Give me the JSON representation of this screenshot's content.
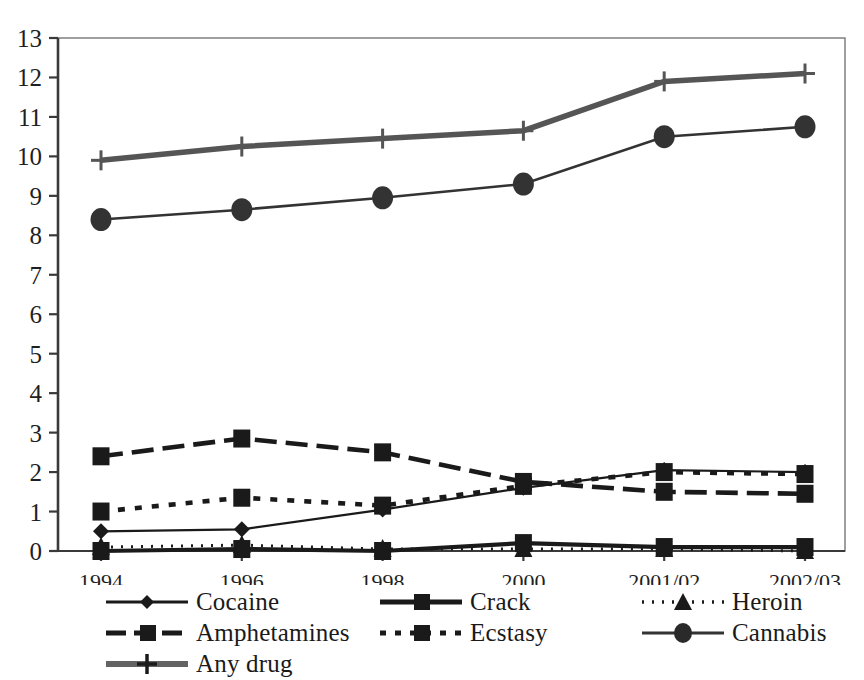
{
  "chart_data": {
    "type": "line",
    "title": "",
    "subtitle": "",
    "xlabel": "",
    "ylabel": "",
    "categories": [
      "1994",
      "1996",
      "1998",
      "2000",
      "2001/02",
      "2002/03"
    ],
    "x": [
      0,
      1,
      2,
      3,
      4,
      5
    ],
    "ylim": [
      0,
      13
    ],
    "yticks": [
      0,
      1,
      2,
      3,
      4,
      5,
      6,
      7,
      8,
      9,
      10,
      11,
      12,
      13
    ],
    "ytick_labels": [
      "0",
      "1",
      "2",
      "3",
      "4",
      "5",
      "6",
      "7",
      "8",
      "9",
      "10",
      "11",
      "12",
      "13"
    ],
    "grid": false,
    "legend_position": "below-plot",
    "series": [
      {
        "name": "Cocaine",
        "marker": "diamond",
        "dash": "solid",
        "color": "#1a1a1a",
        "values": [
          0.5,
          0.55,
          1.05,
          1.6,
          2.05,
          2.0
        ]
      },
      {
        "name": "Crack",
        "marker": "square",
        "dash": "solid",
        "color": "#1a1a1a",
        "values": [
          0.0,
          0.05,
          0.0,
          0.2,
          0.1,
          0.1
        ]
      },
      {
        "name": "Heroin",
        "marker": "triangle",
        "dash": "dotted",
        "color": "#1a1a1a",
        "values": [
          0.1,
          0.15,
          0.05,
          0.05,
          0.05,
          0.0
        ]
      },
      {
        "name": "Amphetamines",
        "marker": "square",
        "dash": "dashed",
        "color": "#1a1a1a",
        "values": [
          2.4,
          2.85,
          2.5,
          1.75,
          1.5,
          1.45
        ]
      },
      {
        "name": "Ecstasy",
        "marker": "square",
        "dash": "dash-dot",
        "color": "#1a1a1a",
        "values": [
          1.0,
          1.35,
          1.15,
          1.65,
          2.0,
          1.95
        ]
      },
      {
        "name": "Cannabis",
        "marker": "circle",
        "dash": "solid",
        "color": "#333333",
        "values": [
          8.4,
          8.65,
          8.95,
          9.3,
          10.5,
          10.75
        ]
      },
      {
        "name": "Any drug",
        "marker": "plus",
        "dash": "solid",
        "color": "#555555",
        "values": [
          9.9,
          10.25,
          10.45,
          10.65,
          11.9,
          12.1
        ]
      }
    ]
  },
  "legend": {
    "columns": [
      {
        "entries": [
          {
            "label": "Cocaine",
            "marker": "diamond-marker",
            "line": "solid"
          },
          {
            "label": "Amphetamines",
            "marker": "square-marker",
            "line": "dashed"
          },
          {
            "label": "Any drug",
            "marker": "plus-marker",
            "line": "thick-solid"
          }
        ]
      },
      {
        "entries": [
          {
            "label": "Crack",
            "marker": "square-marker",
            "line": "thick-solid"
          },
          {
            "label": "Ecstasy",
            "marker": "square-marker",
            "line": "dash-dot"
          }
        ]
      },
      {
        "entries": [
          {
            "label": "Heroin",
            "marker": "triangle-marker",
            "line": "dotted"
          },
          {
            "label": "Cannabis",
            "marker": "circle-marker",
            "line": "solid"
          }
        ]
      }
    ]
  },
  "axis": {
    "y_labels": [
      "13",
      "12",
      "11",
      "10",
      "9",
      "8",
      "7",
      "6",
      "5",
      "4",
      "3",
      "2",
      "1",
      "0"
    ],
    "x_labels": [
      "1994",
      "1996",
      "1998",
      "2000",
      "2001/02",
      "2002/03"
    ]
  },
  "colors": {
    "ink": "#1a1a1a",
    "axis": "#3a3a3a",
    "frame": "#777777",
    "background": "#ffffff"
  }
}
